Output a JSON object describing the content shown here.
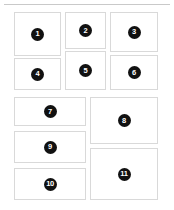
{
  "page": {
    "background_color": "#ffffff",
    "divider_color": "#c9c9c9",
    "panel_border_color": "#d9d9d9",
    "panel_fill_color": "#ffffff",
    "badge_fill_color": "#111111",
    "badge_text_color": "#ffffff"
  },
  "panels": [
    {
      "label": "1",
      "x": 14,
      "y": 12,
      "w": 47,
      "h": 44
    },
    {
      "label": "2",
      "x": 65,
      "y": 12,
      "w": 41,
      "h": 37
    },
    {
      "label": "3",
      "x": 110,
      "y": 12,
      "w": 48,
      "h": 40
    },
    {
      "label": "4",
      "x": 14,
      "y": 58,
      "w": 47,
      "h": 32
    },
    {
      "label": "5",
      "x": 65,
      "y": 51,
      "w": 41,
      "h": 39
    },
    {
      "label": "6",
      "x": 110,
      "y": 55,
      "w": 48,
      "h": 35
    },
    {
      "label": "7",
      "x": 14,
      "y": 97,
      "w": 72,
      "h": 29
    },
    {
      "label": "8",
      "x": 90,
      "y": 97,
      "w": 68,
      "h": 47
    },
    {
      "label": "9",
      "x": 14,
      "y": 131,
      "w": 72,
      "h": 32
    },
    {
      "label": "10",
      "x": 14,
      "y": 168,
      "w": 72,
      "h": 32
    },
    {
      "label": "11",
      "x": 90,
      "y": 148,
      "w": 68,
      "h": 52
    }
  ]
}
